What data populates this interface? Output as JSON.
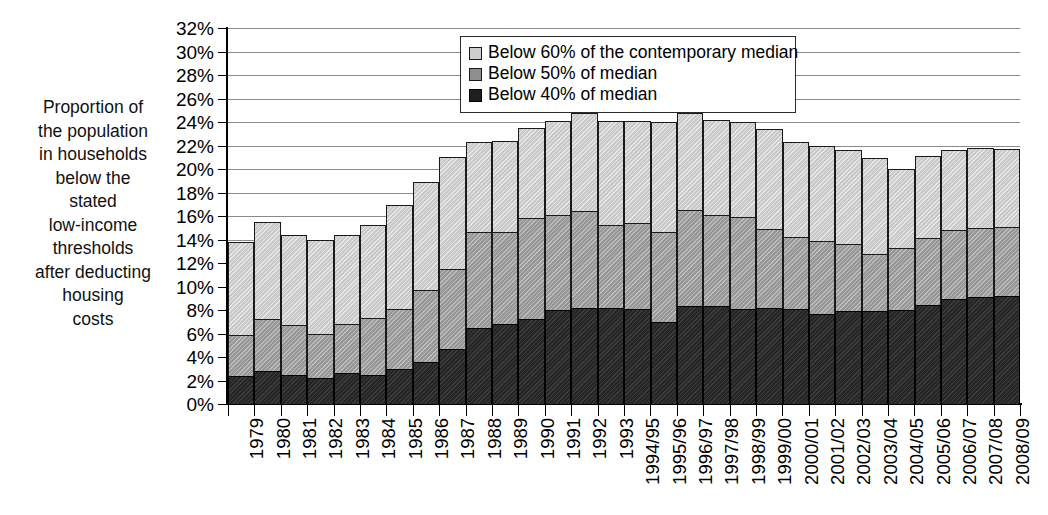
{
  "chart_data": {
    "type": "bar",
    "stacked": true,
    "title": "",
    "xlabel": "",
    "ylabel": "Proportion of the population in households below the stated low-income thresholds after deducting housing costs",
    "ylim": [
      0,
      32
    ],
    "ytick_step": 2,
    "ytick_labels": [
      "32%",
      "30%",
      "28%",
      "26%",
      "24%",
      "22%",
      "20%",
      "18%",
      "16%",
      "14%",
      "12%",
      "10%",
      "8%",
      "6%",
      "4%",
      "2%",
      "0%"
    ],
    "grid": true,
    "legend_position": "top-center",
    "categories": [
      "1979",
      "1980",
      "1981",
      "1982",
      "1983",
      "1984",
      "1985",
      "1986",
      "1987",
      "1988",
      "1989",
      "1990",
      "1991",
      "1992",
      "1993",
      "1994/95",
      "1995/96",
      "1996/97",
      "1997/98",
      "1998/99",
      "1999/00",
      "2000/01",
      "2001/02",
      "2002/03",
      "2003/04",
      "2004/05",
      "2005/06",
      "2006/07",
      "2007/08",
      "2008/09"
    ],
    "series": [
      {
        "name": "Below 60% of the contemporary median",
        "color": "#c9c9c9",
        "values": [
          13.8,
          15.5,
          14.4,
          14.0,
          14.4,
          15.2,
          16.9,
          18.9,
          21.0,
          22.3,
          22.4,
          23.5,
          24.1,
          24.8,
          24.1,
          24.1,
          24.0,
          24.8,
          24.2,
          24.0,
          23.4,
          22.3,
          22.0,
          21.6,
          20.9,
          20.0,
          21.1,
          21.6,
          21.8,
          21.7
        ]
      },
      {
        "name": "Below 50% of median",
        "color": "#979797",
        "values": [
          5.9,
          7.2,
          6.7,
          6.0,
          6.8,
          7.3,
          8.1,
          9.7,
          11.5,
          14.6,
          14.6,
          15.8,
          16.1,
          16.4,
          15.2,
          15.4,
          14.6,
          16.5,
          16.1,
          15.9,
          14.9,
          14.2,
          13.9,
          13.6,
          12.8,
          13.3,
          14.1,
          14.8,
          15.0,
          15.1
        ]
      },
      {
        "name": "Below 40% of median",
        "color": "#262626",
        "values": [
          2.4,
          2.8,
          2.5,
          2.2,
          2.6,
          2.5,
          3.0,
          3.6,
          4.7,
          6.5,
          6.8,
          7.2,
          8.0,
          8.2,
          8.2,
          8.1,
          7.0,
          8.3,
          8.3,
          8.1,
          8.2,
          8.1,
          7.7,
          7.9,
          7.9,
          8.0,
          8.4,
          8.9,
          9.1,
          9.2
        ]
      }
    ]
  },
  "y_caption_lines": [
    "Proportion of",
    "the population",
    "in households",
    "below the",
    "stated",
    "low-income",
    "thresholds",
    "after deducting",
    "housing",
    "costs"
  ],
  "legend": {
    "items": [
      {
        "label": "Below 60% of the contemporary median",
        "swatch": "s60"
      },
      {
        "label": "Below 50% of median",
        "swatch": "s50"
      },
      {
        "label": "Below 40% of median",
        "swatch": "s40"
      }
    ]
  }
}
